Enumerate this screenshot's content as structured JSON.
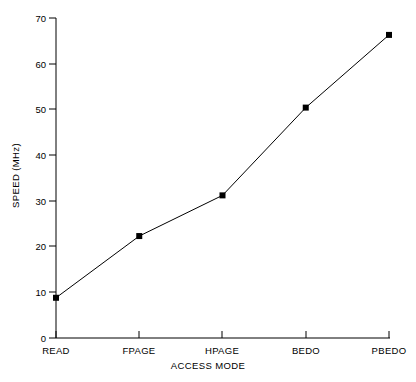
{
  "chart_data": {
    "type": "line",
    "title": "",
    "xlabel": "ACCESS MODE",
    "ylabel": "SPEED (MHz)",
    "categories": [
      "READ",
      "FPAGE",
      "HPAGE",
      "BEDO",
      "PBEDO"
    ],
    "values": [
      8.8,
      22.3,
      31.2,
      50.4,
      66.3
    ],
    "ylim": [
      0,
      70
    ],
    "yticks": [
      0,
      10,
      20,
      30,
      40,
      50,
      60,
      70
    ],
    "ytick_labels": [
      "0",
      "10",
      "20",
      "30",
      "40",
      "50",
      "60",
      "70"
    ],
    "grid": false,
    "legend": null,
    "marker": "filled-square",
    "line_color": "#000000",
    "marker_color": "#000000",
    "background_color": "#ffffff"
  }
}
